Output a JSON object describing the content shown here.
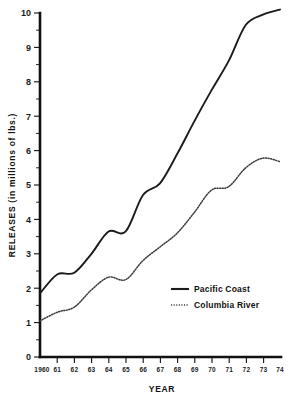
{
  "chart_data": {
    "type": "line",
    "title": "",
    "xlabel": "YEAR",
    "ylabel": "RELEASES (in millions of lbs.)",
    "x": [
      1960,
      1961,
      1962,
      1963,
      1964,
      1965,
      1966,
      1967,
      1968,
      1969,
      1970,
      1971,
      1972,
      1973,
      1974
    ],
    "categories": [
      "1960",
      "61",
      "62",
      "63",
      "64",
      "65",
      "66",
      "67",
      "68",
      "69",
      "70",
      "71",
      "72",
      "73",
      "74"
    ],
    "xlim": [
      1960,
      1974
    ],
    "ylim": [
      0,
      10
    ],
    "yticks": [
      0,
      1,
      2,
      3,
      4,
      5,
      6,
      7,
      8,
      9,
      10
    ],
    "ytick_labels": [
      "0",
      "1",
      "2",
      "3",
      "4",
      "5",
      "6",
      "7",
      "8",
      "9",
      "10"
    ],
    "minor_yticks": [
      0.5,
      1.5,
      2.5,
      3.5,
      4.5,
      5.5,
      6.5,
      7.5,
      8.5,
      9.5
    ],
    "grid": false,
    "legend_position": "center-right",
    "series": [
      {
        "name": "Pacific Coast",
        "style": "solid",
        "color": "#1b1b1b",
        "values": [
          1.85,
          2.4,
          2.45,
          3.0,
          3.65,
          3.65,
          4.7,
          5.05,
          5.9,
          6.85,
          7.75,
          8.6,
          9.65,
          9.95,
          10.1
        ]
      },
      {
        "name": "Columbia River",
        "style": "dotted",
        "color": "#3a3a3a",
        "values": [
          1.05,
          1.3,
          1.45,
          1.95,
          2.32,
          2.25,
          2.8,
          3.2,
          3.6,
          4.2,
          4.85,
          4.95,
          5.5,
          5.78,
          5.68
        ]
      }
    ]
  },
  "legend": {
    "items": [
      {
        "label": "Pacific Coast",
        "style": "solid"
      },
      {
        "label": "Columbia River",
        "style": "dotted"
      }
    ]
  },
  "axes": {
    "y_title": "RELEASES (in millions of lbs.)",
    "x_title": "YEAR"
  }
}
